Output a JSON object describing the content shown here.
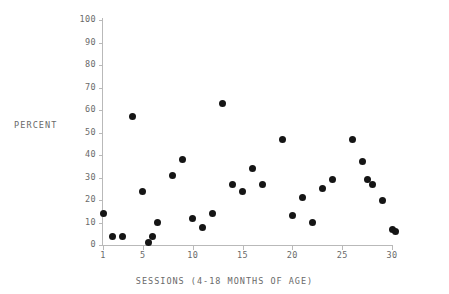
{
  "chart_data": {
    "type": "scatter",
    "title": "",
    "xlabel": "SESSIONS (4-18 MONTHS OF AGE)",
    "ylabel": "PERCENT",
    "xlim": [
      0,
      31
    ],
    "ylim": [
      0,
      100
    ],
    "grid": false,
    "legend": null,
    "xticks": [
      1,
      5,
      10,
      15,
      20,
      25,
      30
    ],
    "xtick_labels": [
      "1",
      "5",
      "10",
      "15",
      "20",
      "25",
      "30"
    ],
    "yticks": [
      0,
      10,
      20,
      30,
      40,
      50,
      60,
      70,
      80,
      90,
      100
    ],
    "ytick_labels": [
      "0",
      "10",
      "20",
      "30",
      "40",
      "50",
      "60",
      "70",
      "80",
      "90",
      "100"
    ],
    "marker": {
      "shape": "circle",
      "color": "#151515",
      "size_px": 7
    },
    "axis_color": "#b9b9b9",
    "text_color": "#6a6a6a",
    "background": "#ffffff",
    "x": [
      1,
      2,
      3,
      4,
      5,
      5.6,
      6,
      6.5,
      8,
      9,
      10,
      11,
      12,
      13,
      14,
      15,
      16,
      17,
      19,
      20,
      21,
      22,
      23,
      24,
      26,
      27,
      27.5,
      28,
      29,
      30,
      30.4
    ],
    "y": [
      14,
      4,
      4,
      57,
      24,
      1,
      4,
      10,
      31,
      38,
      12,
      8,
      14,
      63,
      27,
      24,
      34,
      27,
      47,
      13,
      21,
      10,
      25,
      29,
      47,
      37,
      29,
      27,
      20,
      7,
      6
    ],
    "points": [
      {
        "x": 1,
        "y": 14
      },
      {
        "x": 2,
        "y": 4
      },
      {
        "x": 3,
        "y": 4
      },
      {
        "x": 4,
        "y": 57
      },
      {
        "x": 5,
        "y": 24
      },
      {
        "x": 5.6,
        "y": 1
      },
      {
        "x": 6,
        "y": 4
      },
      {
        "x": 6.5,
        "y": 10
      },
      {
        "x": 8,
        "y": 31
      },
      {
        "x": 9,
        "y": 38
      },
      {
        "x": 10,
        "y": 12
      },
      {
        "x": 11,
        "y": 8
      },
      {
        "x": 12,
        "y": 14
      },
      {
        "x": 13,
        "y": 63
      },
      {
        "x": 14,
        "y": 27
      },
      {
        "x": 15,
        "y": 24
      },
      {
        "x": 16,
        "y": 34
      },
      {
        "x": 17,
        "y": 27
      },
      {
        "x": 19,
        "y": 47
      },
      {
        "x": 20,
        "y": 13
      },
      {
        "x": 21,
        "y": 21
      },
      {
        "x": 22,
        "y": 10
      },
      {
        "x": 23,
        "y": 25
      },
      {
        "x": 24,
        "y": 29
      },
      {
        "x": 26,
        "y": 47
      },
      {
        "x": 27,
        "y": 37
      },
      {
        "x": 27.5,
        "y": 29
      },
      {
        "x": 28,
        "y": 27
      },
      {
        "x": 29,
        "y": 20
      },
      {
        "x": 30,
        "y": 7
      },
      {
        "x": 30.4,
        "y": 6
      }
    ]
  }
}
